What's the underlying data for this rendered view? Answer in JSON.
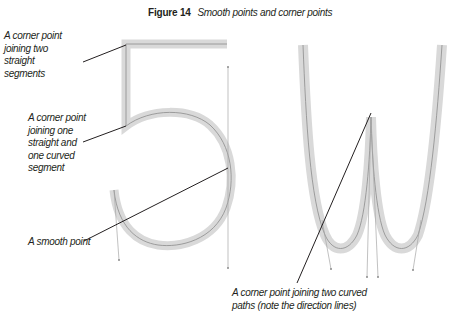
{
  "figure": {
    "number_label": "Figure 14",
    "title": "Smooth points and corner points"
  },
  "annotations": [
    {
      "id": "corner-straight-straight",
      "lines": [
        "A corner point",
        "joining two",
        "straight",
        "segments"
      ]
    },
    {
      "id": "corner-straight-curved",
      "lines": [
        "A corner point",
        "joining one",
        "straight and",
        "one curved",
        "segment"
      ]
    },
    {
      "id": "smooth-point",
      "lines": [
        "A smooth point"
      ]
    },
    {
      "id": "corner-curved-curved",
      "lines": [
        "A corner point joining two curved",
        "paths (note the direction lines)"
      ]
    }
  ],
  "glyphs": [
    "5",
    "W"
  ],
  "colors": {
    "stroke_band": "#d9d9d9",
    "path_line": "#8c8c8c",
    "leader_line": "#231f20",
    "direction_line": "#a6a6a6",
    "text": "#231f20"
  }
}
